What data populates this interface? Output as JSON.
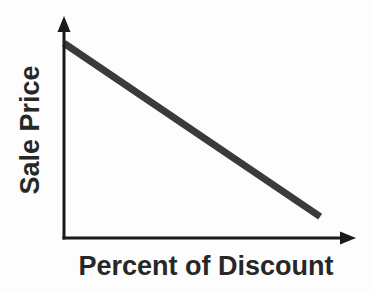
{
  "chart_data": {
    "type": "line",
    "title": "",
    "xlabel": "Percent of Discount",
    "ylabel": "Sale Price",
    "x": [
      0,
      100
    ],
    "y": [
      100,
      11
    ],
    "xlim": [
      0,
      114
    ],
    "ylim": [
      0,
      114
    ],
    "grid": false,
    "legend": false,
    "tick_labels": "none",
    "axes_arrows": true,
    "line_color": "#3a3a3a",
    "line_width_px": 7,
    "axis_color": "#1a1a1a",
    "label_color": "#272727",
    "background_color": "#fdfdfd"
  }
}
